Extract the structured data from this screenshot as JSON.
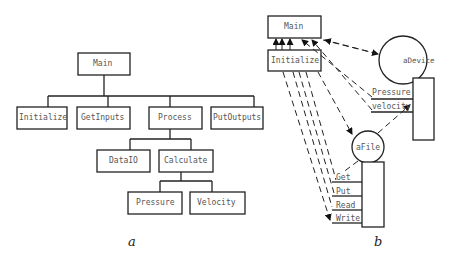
{
  "diagram_a": {
    "caption": "a",
    "nodes": {
      "main": "Main",
      "initialize": "Initialize",
      "get_inputs": "GetInputs",
      "process": "Process",
      "put_outputs": "PutOutputs",
      "data_io": "DataIO",
      "calculate": "Calculate",
      "pressure": "Pressure",
      "velocity": "Velocity"
    },
    "edges": [
      [
        "Main",
        "Initialize"
      ],
      [
        "Main",
        "GetInputs"
      ],
      [
        "Main",
        "Process"
      ],
      [
        "Main",
        "PutOutputs"
      ],
      [
        "Process",
        "DataIO"
      ],
      [
        "Process",
        "Calculate"
      ],
      [
        "Calculate",
        "Pressure"
      ],
      [
        "Calculate",
        "Velocity"
      ]
    ]
  },
  "diagram_b": {
    "caption": "b",
    "modules": {
      "main": "Main",
      "initialize": "Initialize"
    },
    "objects": {
      "a_device": {
        "name": "aDevice",
        "methods": [
          "Pressure",
          "velocity"
        ]
      },
      "a_file": {
        "name": "aFile",
        "methods": [
          "Get",
          "Put",
          "Read",
          "Write"
        ]
      }
    }
  }
}
